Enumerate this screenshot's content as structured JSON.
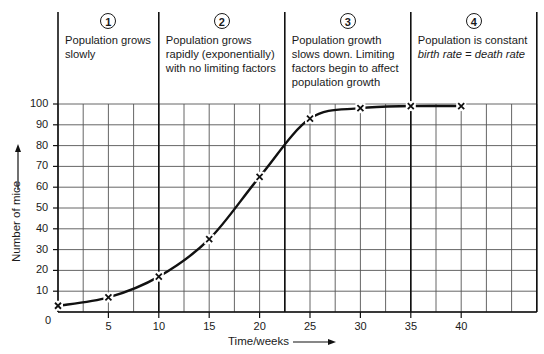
{
  "chart_data": {
    "type": "line",
    "title": "",
    "xlabel": "Time/weeks",
    "ylabel": "Number of mice",
    "x": [
      0,
      5,
      10,
      15,
      20,
      25,
      30,
      35,
      40
    ],
    "series": [
      {
        "name": "Mouse population",
        "values": [
          3,
          7,
          17,
          35,
          65,
          93,
          98,
          99,
          99
        ],
        "marker": "x"
      }
    ],
    "xticks": [
      0,
      5,
      10,
      15,
      20,
      25,
      30,
      35,
      40
    ],
    "yticks": [
      10,
      20,
      30,
      40,
      50,
      60,
      70,
      80,
      90,
      100
    ],
    "xlim": [
      0,
      47.5
    ],
    "ylim": [
      0,
      100
    ],
    "grid": true,
    "grid_x_step": 2.5,
    "grid_y_step": 10,
    "stage_dividers_x": [
      0,
      10,
      22.5,
      35,
      47.5
    ],
    "stages": [
      {
        "number": "1",
        "text_lines": [
          "Population grows",
          "slowly"
        ]
      },
      {
        "number": "2",
        "text_lines": [
          "Population grows",
          "rapidly (exponentially)",
          "with no limiting factors"
        ]
      },
      {
        "number": "3",
        "text_lines": [
          "Population growth",
          "slows down. Limiting",
          "factors begin to affect",
          "population growth"
        ]
      },
      {
        "number": "4",
        "text_lines": [
          "Population is constant"
        ],
        "italic_line": "birth rate = death rate"
      }
    ]
  },
  "labels": {
    "xlabel": "Time/weeks",
    "ylabel": "Number of mice",
    "origin": "0"
  }
}
